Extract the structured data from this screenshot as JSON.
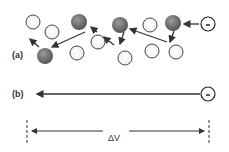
{
  "figure": {
    "panel_a_label": "(a)",
    "panel_b_label": "(b)",
    "electron_symbol": "-",
    "voltage_label": "ΔV"
  },
  "colors": {
    "atom_dark": "#6e6e6e",
    "atom_light": "#ffffff",
    "stroke": "#333333"
  },
  "panel_a": {
    "light_atoms": [
      [
        33,
        22
      ],
      [
        52,
        32
      ],
      [
        77,
        53
      ],
      [
        98,
        42
      ],
      [
        150,
        25
      ],
      [
        125,
        58
      ],
      [
        152,
        51
      ],
      [
        176,
        52
      ]
    ],
    "dark_atoms": [
      [
        79,
        22
      ],
      [
        45,
        56
      ],
      [
        120,
        25
      ],
      [
        173,
        23
      ]
    ],
    "electron": [
      208,
      24
    ]
  },
  "panel_b": {
    "electron": [
      208,
      94
    ]
  }
}
